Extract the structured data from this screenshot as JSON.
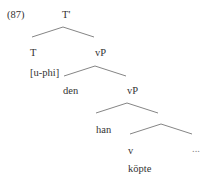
{
  "example_number": "(87)",
  "nodes": {
    "root": "T'",
    "t_head": "T",
    "t_feature": "[u-phi]",
    "vp1": "vP",
    "spec1": "den",
    "vp2": "vP",
    "spec2": "han",
    "v_head": "v",
    "v_word": "köpte",
    "rest": "..."
  }
}
